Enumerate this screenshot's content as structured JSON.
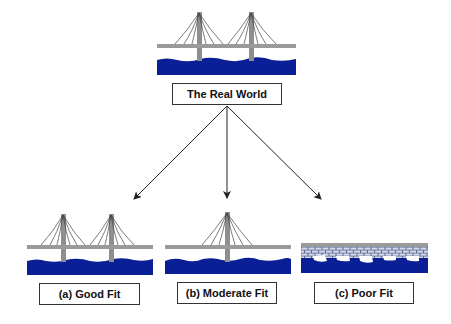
{
  "diagram": {
    "root": {
      "label": "The Real World",
      "image": "two-tower-suspension-bridge"
    },
    "children": [
      {
        "label": "(a) Good Fit",
        "image": "two-tower-suspension-bridge"
      },
      {
        "label": "(b) Moderate Fit",
        "image": "single-tower-suspension-bridge"
      },
      {
        "label": "(c) Poor Fit",
        "image": "stone-brick-bridge"
      }
    ],
    "edges": [
      {
        "from": "root",
        "to": "(a) Good Fit"
      },
      {
        "from": "root",
        "to": "(b) Moderate Fit"
      },
      {
        "from": "root",
        "to": "(c) Poor Fit"
      }
    ],
    "colors": {
      "water": "#0a1f96",
      "deck": "#9a9a9a",
      "tower": "#8e8e8e",
      "cable": "#444444",
      "brick": "#c8cde0",
      "arrow": "#222222"
    }
  }
}
